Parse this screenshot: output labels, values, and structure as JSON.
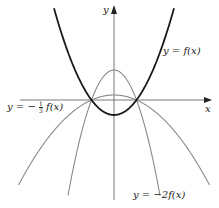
{
  "chart_data": {
    "type": "line",
    "title": "",
    "xlabel": "x",
    "ylabel": "y",
    "grid": false,
    "legend": "inline labels",
    "roots": [
      -1,
      1
    ],
    "series": [
      {
        "name": "y = f(x)",
        "formula": "x^2 - 1",
        "style": "dark thick",
        "vertex": [
          0,
          -1
        ]
      },
      {
        "name": "y = -2f(x)",
        "formula": "-2(x^2 - 1)",
        "style": "gray",
        "vertex": [
          0,
          2
        ]
      },
      {
        "name": "y = -1/3 f(x)",
        "formula": "-(1/3)(x^2 - 1)",
        "style": "gray",
        "vertex": [
          0,
          0.333
        ]
      }
    ]
  },
  "labels": {
    "y_axis": "y",
    "x_axis": "x",
    "f": "y = f(x)",
    "neg2f_prefix": "y = −2",
    "neg2f_suffix": "f(x)",
    "third_prefix": "y = −",
    "third_num": "1",
    "third_den": "3",
    "third_suffix": "f(x)"
  },
  "colors": {
    "dark": "#1a1a1a",
    "gray": "#8a8a8a",
    "axis": "#555555"
  }
}
